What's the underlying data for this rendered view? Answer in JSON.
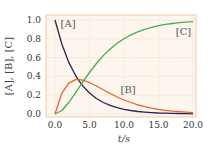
{
  "chart_data": {
    "type": "line",
    "title": "",
    "xlabel": "t/s",
    "ylabel": "[A], [B], [C]",
    "xlim": [
      0,
      20
    ],
    "ylim": [
      0,
      1.0
    ],
    "xticks": [
      "0.0",
      "5.0",
      "10.0",
      "15.0",
      "20.0"
    ],
    "yticks": [
      "0.0",
      "0.2",
      "0.4",
      "0.6",
      "0.8",
      "1.0"
    ],
    "grid": true,
    "legend": "inline annotations",
    "x": [
      0,
      1,
      2,
      3,
      3.33,
      4,
      5,
      6,
      7,
      8,
      9,
      10,
      11,
      12,
      13,
      14,
      15,
      16,
      17,
      18,
      19,
      20
    ],
    "series": [
      {
        "name": "[A]",
        "color": "#2b2350",
        "values": [
          1.0,
          0.741,
          0.549,
          0.407,
          0.368,
          0.301,
          0.223,
          0.165,
          0.122,
          0.091,
          0.067,
          0.05,
          0.037,
          0.027,
          0.02,
          0.015,
          0.011,
          0.008,
          0.006,
          0.005,
          0.003,
          0.002
        ]
      },
      {
        "name": "[B]",
        "color": "#e8602c",
        "values": [
          0.0,
          0.222,
          0.329,
          0.366,
          0.368,
          0.361,
          0.335,
          0.298,
          0.257,
          0.218,
          0.181,
          0.149,
          0.122,
          0.098,
          0.079,
          0.063,
          0.05,
          0.039,
          0.031,
          0.024,
          0.019,
          0.015
        ]
      },
      {
        "name": "[C]",
        "color": "#4caa4c",
        "values": [
          0.0,
          0.037,
          0.122,
          0.227,
          0.264,
          0.338,
          0.442,
          0.537,
          0.621,
          0.691,
          0.752,
          0.801,
          0.841,
          0.875,
          0.901,
          0.922,
          0.939,
          0.953,
          0.963,
          0.971,
          0.978,
          0.983
        ]
      }
    ],
    "annotations": [
      {
        "text": "[A]",
        "x": 0.8,
        "y": 0.93
      },
      {
        "text": "[B]",
        "x": 9.5,
        "y": 0.22
      },
      {
        "text": "[C]",
        "x": 17.5,
        "y": 0.84
      }
    ]
  }
}
